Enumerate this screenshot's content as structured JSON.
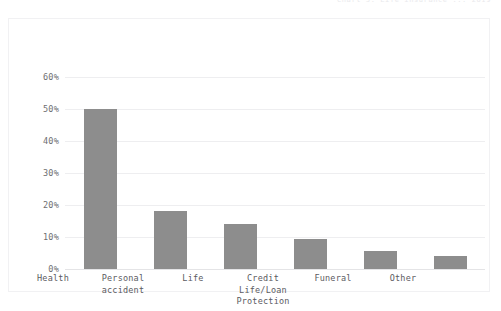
{
  "page_header": "Chart 3: Life insurance ... 2019",
  "chart_data": {
    "type": "bar",
    "title": "",
    "subtitle": "",
    "xlabel": "",
    "ylabel": "",
    "categories": [
      "Health",
      "Personal\naccident",
      "Life",
      "Credit\nLife/Loan\nProtection",
      "Funeral",
      "Other"
    ],
    "values": [
      50,
      18,
      14,
      9.5,
      5.5,
      4
    ],
    "value_labels": [
      "50%",
      "18%",
      "14%",
      "9.5%",
      "5.5%",
      "4%"
    ],
    "ylim": [
      0,
      60
    ],
    "ytick_labels": [
      "0%",
      "10%",
      "20%",
      "30%",
      "40%",
      "50%",
      "60%"
    ],
    "ytick_values": [
      0,
      10,
      20,
      30,
      40,
      50,
      60
    ],
    "grid": true,
    "legend": false,
    "legend_position": "none",
    "bar_color": "#8d8d8d",
    "grid_color": "#eeeef0",
    "axis_label_color": "#5b5b5f",
    "frame_color": "#f1f1f3",
    "background_color": "#ffffff"
  }
}
